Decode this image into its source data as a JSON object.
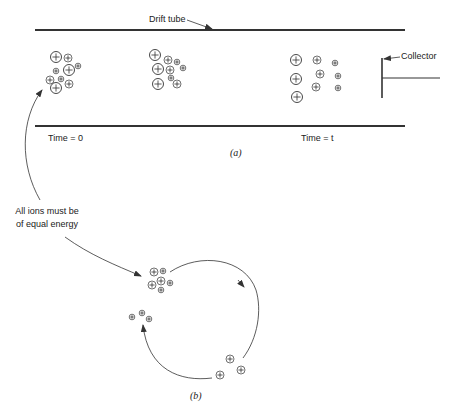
{
  "figure": {
    "panel_a": {
      "caption": "(a)",
      "drift_tube_label": "Drift tube",
      "collector_label": "Collector",
      "time_start_label": "Time = 0",
      "time_end_label": "Time = t",
      "ion_groups": [
        {
          "name": "cluster-time-0",
          "ions": [
            {
              "x": 56,
              "y": 57,
              "r": 5.5
            },
            {
              "x": 68,
              "y": 58,
              "r": 4
            },
            {
              "x": 69,
              "y": 70,
              "r": 5.5
            },
            {
              "x": 78,
              "y": 66,
              "r": 2.8
            },
            {
              "x": 56,
              "y": 71,
              "r": 2.8
            },
            {
              "x": 50,
              "y": 80,
              "r": 4
            },
            {
              "x": 61,
              "y": 79,
              "r": 2.8
            },
            {
              "x": 56,
              "y": 88,
              "r": 5.5
            },
            {
              "x": 69,
              "y": 84,
              "r": 4
            }
          ]
        },
        {
          "name": "cluster-middle",
          "ions": [
            {
              "x": 155,
              "y": 55,
              "r": 5.5
            },
            {
              "x": 168,
              "y": 60,
              "r": 4
            },
            {
              "x": 177,
              "y": 62,
              "r": 2.8
            },
            {
              "x": 158,
              "y": 69,
              "r": 5.5
            },
            {
              "x": 170,
              "y": 70,
              "r": 4
            },
            {
              "x": 183,
              "y": 68,
              "r": 2.8
            },
            {
              "x": 171,
              "y": 78,
              "r": 2.8
            },
            {
              "x": 158,
              "y": 84,
              "r": 5.5
            },
            {
              "x": 177,
              "y": 84,
              "r": 4
            }
          ]
        },
        {
          "name": "cluster-time-t",
          "ions": [
            {
              "x": 296,
              "y": 60,
              "r": 5.5
            },
            {
              "x": 296,
              "y": 79,
              "r": 5.5
            },
            {
              "x": 297,
              "y": 97,
              "r": 5.5
            },
            {
              "x": 317,
              "y": 60,
              "r": 4
            },
            {
              "x": 320,
              "y": 74,
              "r": 4
            },
            {
              "x": 316,
              "y": 87,
              "r": 4
            },
            {
              "x": 335,
              "y": 63,
              "r": 2.8
            },
            {
              "x": 338,
              "y": 76,
              "r": 2.8
            },
            {
              "x": 338,
              "y": 88,
              "r": 2.8
            }
          ]
        }
      ]
    },
    "annotation": {
      "line1": "All ions must be",
      "line2": "of equal energy"
    },
    "panel_b": {
      "caption": "(b)",
      "ion_groups": [
        {
          "name": "cluster-top",
          "ions": [
            {
              "x": 154,
              "y": 272,
              "r": 4
            },
            {
              "x": 163,
              "y": 271,
              "r": 2.8
            },
            {
              "x": 161,
              "y": 281,
              "r": 4
            },
            {
              "x": 152,
              "y": 285,
              "r": 4
            },
            {
              "x": 170,
              "y": 283,
              "r": 2.8
            },
            {
              "x": 161,
              "y": 290,
              "r": 2.8
            }
          ]
        },
        {
          "name": "cluster-left",
          "ions": [
            {
              "x": 132,
              "y": 317,
              "r": 2.8
            },
            {
              "x": 142,
              "y": 313,
              "r": 2.8
            },
            {
              "x": 149,
              "y": 319,
              "r": 2.8
            }
          ]
        },
        {
          "name": "cluster-bottom-right",
          "ions": [
            {
              "x": 230,
              "y": 359,
              "r": 4
            },
            {
              "x": 241,
              "y": 370,
              "r": 4
            },
            {
              "x": 220,
              "y": 375,
              "r": 4
            }
          ]
        }
      ]
    }
  }
}
